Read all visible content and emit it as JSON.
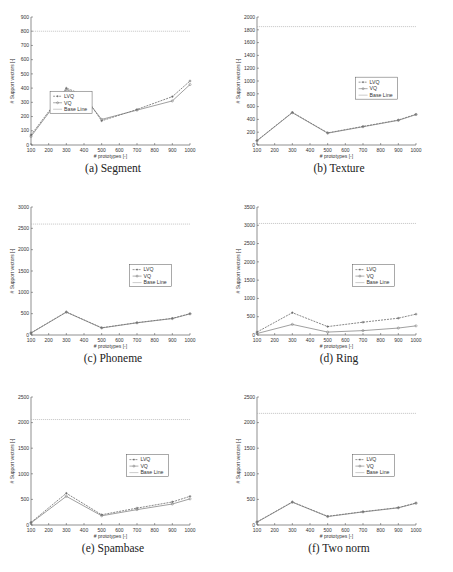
{
  "chart_data": [
    {
      "id": "a",
      "type": "line",
      "caption": "(a)  Segment",
      "xlabel": "# prototypes [-]",
      "ylabel": "# Support vectors [-]",
      "x": [
        100,
        300,
        400,
        500,
        700,
        900,
        1000
      ],
      "xticks": [
        100,
        200,
        300,
        400,
        500,
        600,
        700,
        800,
        900,
        1000
      ],
      "ylim": [
        0,
        900
      ],
      "yticks": [
        0,
        100,
        200,
        300,
        400,
        500,
        600,
        700,
        800,
        900
      ],
      "baseline": 800,
      "legend": {
        "pos": [
          0.12,
          0.58
        ]
      },
      "series": [
        {
          "name": "LVQ",
          "values": [
            70,
            400,
            350,
            170,
            250,
            340,
            450
          ],
          "dashed": true
        },
        {
          "name": "VQ",
          "values": [
            60,
            390,
            340,
            180,
            245,
            310,
            425
          ],
          "dashed": false
        },
        {
          "name": "Base Line",
          "values": [],
          "dashed": false
        }
      ]
    },
    {
      "id": "b",
      "type": "line",
      "caption": "(b)  Texture",
      "xlabel": "# prototypes [-]",
      "ylabel": "# Support vectors [-]",
      "x": [
        100,
        300,
        500,
        700,
        900,
        1000
      ],
      "xticks": [
        100,
        200,
        300,
        400,
        500,
        600,
        700,
        800,
        900,
        1000
      ],
      "ylim": [
        0,
        2000
      ],
      "yticks": [
        0,
        200,
        400,
        600,
        800,
        1000,
        1200,
        1400,
        1600,
        1800,
        2000
      ],
      "baseline": 1850,
      "legend": {
        "pos": [
          0.62,
          0.47
        ]
      },
      "series": [
        {
          "name": "LVQ",
          "values": [
            70,
            510,
            190,
            290,
            390,
            480
          ],
          "dashed": true
        },
        {
          "name": "VQ",
          "values": [
            65,
            505,
            185,
            285,
            385,
            475
          ],
          "dashed": false
        },
        {
          "name": "Base Line",
          "values": [],
          "dashed": false
        }
      ]
    },
    {
      "id": "c",
      "type": "line",
      "caption": "(c)  Phoneme",
      "xlabel": "# prototypes [-]",
      "ylabel": "# Support vectors [-]",
      "x": [
        100,
        300,
        500,
        700,
        900,
        1000
      ],
      "xticks": [
        100,
        200,
        300,
        400,
        500,
        600,
        700,
        800,
        900,
        1000
      ],
      "ylim": [
        0,
        3000
      ],
      "yticks": [
        0,
        500,
        1000,
        1500,
        2000,
        2500,
        3000
      ],
      "baseline": 2600,
      "legend": {
        "pos": [
          0.62,
          0.45
        ]
      },
      "series": [
        {
          "name": "LVQ",
          "values": [
            50,
            540,
            170,
            290,
            390,
            500
          ],
          "dashed": true
        },
        {
          "name": "VQ",
          "values": [
            45,
            535,
            165,
            285,
            385,
            495
          ],
          "dashed": false
        },
        {
          "name": "Base Line",
          "values": [],
          "dashed": false
        }
      ]
    },
    {
      "id": "d",
      "type": "line",
      "caption": "(d)  Ring",
      "xlabel": "# prototypes [-]",
      "ylabel": "# Support vectors [-]",
      "x": [
        100,
        300,
        500,
        700,
        900,
        1000
      ],
      "xticks": [
        100,
        200,
        300,
        400,
        500,
        600,
        700,
        800,
        900,
        1000
      ],
      "ylim": [
        0,
        3500
      ],
      "yticks": [
        0,
        500,
        1000,
        1500,
        2000,
        2500,
        3000,
        3500
      ],
      "baseline": 3050,
      "legend": {
        "pos": [
          0.6,
          0.45
        ]
      },
      "series": [
        {
          "name": "LVQ",
          "values": [
            80,
            610,
            230,
            350,
            460,
            570
          ],
          "dashed": true
        },
        {
          "name": "VQ",
          "values": [
            40,
            290,
            80,
            120,
            190,
            250
          ],
          "dashed": false
        },
        {
          "name": "Base Line",
          "values": [],
          "dashed": false
        }
      ]
    },
    {
      "id": "e",
      "type": "line",
      "caption": "(e)  Spambase",
      "xlabel": "# prototypes [-]",
      "ylabel": "# Support vectors [-]",
      "x": [
        100,
        300,
        500,
        700,
        900,
        1000
      ],
      "xticks": [
        100,
        200,
        300,
        400,
        500,
        600,
        700,
        800,
        900,
        1000
      ],
      "ylim": [
        0,
        2500
      ],
      "yticks": [
        0,
        500,
        1000,
        1500,
        2000,
        2500
      ],
      "baseline": 2060,
      "legend": {
        "pos": [
          0.6,
          0.45
        ]
      },
      "series": [
        {
          "name": "LVQ",
          "values": [
            50,
            620,
            200,
            330,
            450,
            560
          ],
          "dashed": true
        },
        {
          "name": "VQ",
          "values": [
            40,
            560,
            180,
            300,
            410,
            510
          ],
          "dashed": false
        },
        {
          "name": "Base Line",
          "values": [],
          "dashed": false
        }
      ]
    },
    {
      "id": "f",
      "type": "line",
      "caption": "(f)  Two norm",
      "xlabel": "# prototypes [-]",
      "ylabel": "# Support vectors [-]",
      "x": [
        100,
        300,
        500,
        700,
        900,
        1000
      ],
      "xticks": [
        100,
        200,
        300,
        400,
        500,
        600,
        700,
        800,
        900,
        1000
      ],
      "ylim": [
        0,
        2500
      ],
      "yticks": [
        0,
        500,
        1000,
        1500,
        2000,
        2500
      ],
      "baseline": 2180,
      "legend": {
        "pos": [
          0.6,
          0.45
        ]
      },
      "series": [
        {
          "name": "LVQ",
          "values": [
            60,
            450,
            170,
            260,
            340,
            430
          ],
          "dashed": true
        },
        {
          "name": "VQ",
          "values": [
            55,
            445,
            165,
            255,
            335,
            425
          ],
          "dashed": false
        },
        {
          "name": "Base Line",
          "values": [],
          "dashed": false
        }
      ]
    }
  ],
  "colors": {
    "axis": "#444444",
    "lvq": "#555555",
    "vq": "#777777",
    "baseline": "#aaaaaa"
  }
}
